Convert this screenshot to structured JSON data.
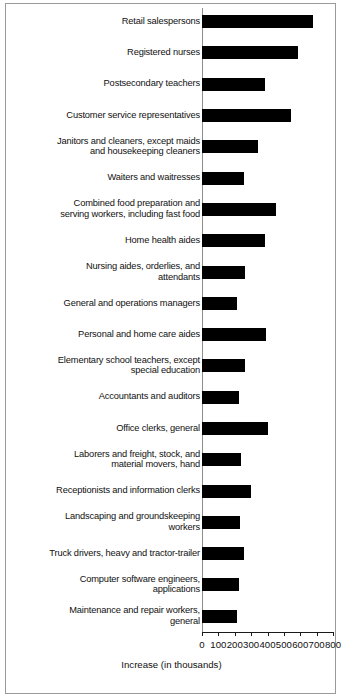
{
  "chart_data": {
    "type": "bar",
    "orientation": "horizontal",
    "title": "",
    "subtitle": "",
    "xlabel": "Increase (in thousands)",
    "ylabel": "",
    "xlim": [
      0,
      800
    ],
    "xticks": [
      0,
      100,
      200,
      300,
      400,
      500,
      600,
      700,
      800
    ],
    "xtick_labels": [
      "0",
      "100",
      "200",
      "300",
      "400",
      "500",
      "600",
      "700",
      "800"
    ],
    "grid": false,
    "legend": null,
    "bar_color": "#000000",
    "categories": [
      "Retail salespersons",
      "Registered nurses",
      "Postsecondary teachers",
      "Customer service representatives",
      "Janitors and cleaners, except maids\nand housekeeping cleaners",
      "Waiters and waitresses",
      "Combined food preparation and\nserving workers, including fast food",
      "Home health aides",
      "Nursing aides, orderlies, and\nattendants",
      "General and operations managers",
      "Personal and home care aides",
      "Elementary school teachers, except\nspecial education",
      "Accountants and auditors",
      "Office clerks, general",
      "Laborers and freight, stock, and\nmaterial movers, hand",
      "Receptionists and information clerks",
      "Landscaping and groundskeeping\nworkers",
      "Truck drivers, heavy and tractor-trailer",
      "Computer software engineers,\napplications",
      "Maintenance and repair workers,\ngeneral"
    ],
    "values": [
      557,
      587,
      382,
      545,
      345,
      255,
      452,
      384,
      264,
      215,
      389,
      265,
      226,
      404,
      236,
      302,
      234,
      258,
      226,
      216
    ],
    "values_display": [
      680,
      587,
      382,
      545,
      345,
      255,
      452,
      384,
      264,
      215,
      389,
      265,
      226,
      404,
      236,
      302,
      234,
      258,
      226,
      216
    ]
  },
  "axis": {
    "x_title": "Increase (in thousands)"
  }
}
